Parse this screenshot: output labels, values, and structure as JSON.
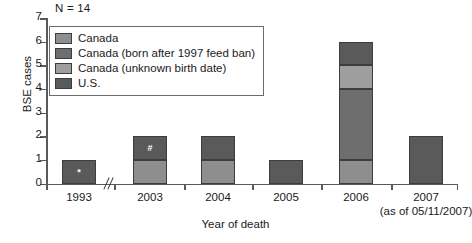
{
  "chart_data": {
    "type": "bar",
    "subtype": "stacked-bar",
    "title": "",
    "xlabel": "Year of death",
    "ylabel": "BSE cases",
    "ylim": [
      0,
      7
    ],
    "yticks": [
      0,
      1,
      2,
      3,
      4,
      5,
      6,
      7
    ],
    "grid": false,
    "legend_position": "upper-left-inside",
    "annotation": "N = 14",
    "axis_break_after_category": "1993",
    "categories": [
      "1993",
      "2003",
      "2004",
      "2005",
      "2006",
      "2007"
    ],
    "category_notes": {
      "2007": "(as of 05/11/2007)"
    },
    "series": [
      {
        "name": "Canada",
        "color": "#8e8e8e",
        "values": [
          0,
          1,
          1,
          0,
          1,
          0
        ]
      },
      {
        "name": "Canada (born after 1997 feed ban)",
        "color": "#6e6e6e",
        "values": [
          0,
          0,
          0,
          0,
          3,
          0
        ]
      },
      {
        "name": "Canada (unknown birth date)",
        "color": "#9e9e9e",
        "values": [
          0,
          0,
          0,
          0,
          1,
          0
        ]
      },
      {
        "name": "U.S.",
        "color": "#5a5a5a",
        "values": [
          1,
          1,
          1,
          1,
          1,
          2
        ]
      }
    ],
    "totals": [
      1,
      2,
      2,
      1,
      6,
      2
    ],
    "bar_markers": [
      {
        "category": "1993",
        "series": "U.S.",
        "text": "*"
      },
      {
        "category": "2003",
        "series": "U.S.",
        "text": "#"
      }
    ]
  },
  "legend": {
    "items": [
      {
        "label": "Canada",
        "color": "#8e8e8e"
      },
      {
        "label": "Canada (born after 1997 feed ban)",
        "color": "#6e6e6e"
      },
      {
        "label": "Canada (unknown birth date)",
        "color": "#9e9e9e"
      },
      {
        "label": "U.S.",
        "color": "#5a5a5a"
      }
    ]
  },
  "axes": {
    "y_title": "BSE cases",
    "x_title": "Year of death"
  }
}
